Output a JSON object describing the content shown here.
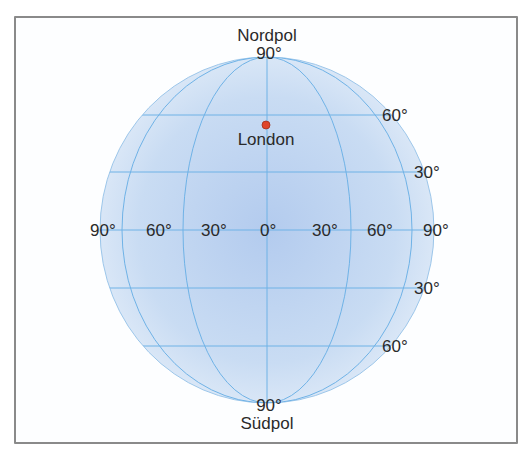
{
  "diagram": {
    "north_pole_label": "Nordpol",
    "south_pole_label": "Südpol",
    "city": {
      "name": "London",
      "marker_color": "#e0452a"
    },
    "colors": {
      "globe_center": "#b7cff0",
      "globe_edge": "#dbe8f7",
      "grid_line": "#6fb2e6",
      "frame": "#8a8a8a"
    },
    "top_latitude_label": "90°",
    "bottom_latitude_label": "90°",
    "equator_longitude_labels": [
      "90°",
      "60°",
      "30°",
      "0°",
      "30°",
      "60°",
      "90°"
    ],
    "northern_latitude_labels": [
      "60°",
      "30°"
    ],
    "southern_latitude_labels": [
      "30°",
      "60°"
    ]
  }
}
